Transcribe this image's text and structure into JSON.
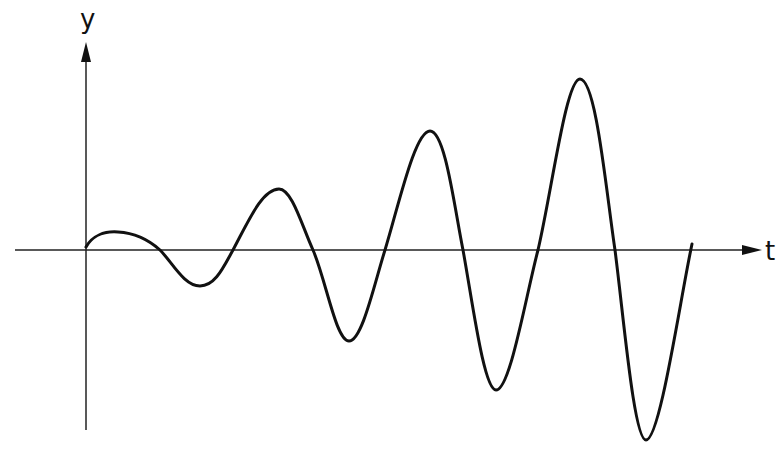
{
  "diagram": {
    "axes": {
      "y_label": "y",
      "x_label": "t"
    },
    "colors": {
      "background": "#ffffff",
      "stroke": "#111111"
    },
    "curve": {
      "type": "oscillation-increasing-amplitude",
      "extrema": [
        {
          "kind": "start",
          "x": 86,
          "y": 247
        },
        {
          "kind": "peak",
          "x": 118,
          "y": 232
        },
        {
          "kind": "trough",
          "x": 200,
          "y": 286
        },
        {
          "kind": "peak",
          "x": 279,
          "y": 189
        },
        {
          "kind": "trough",
          "x": 349,
          "y": 341
        },
        {
          "kind": "peak",
          "x": 430,
          "y": 131
        },
        {
          "kind": "trough",
          "x": 496,
          "y": 390
        },
        {
          "kind": "peak",
          "x": 580,
          "y": 79
        },
        {
          "kind": "trough",
          "x": 646,
          "y": 440
        },
        {
          "kind": "end",
          "x": 692,
          "y": 244
        }
      ]
    }
  }
}
